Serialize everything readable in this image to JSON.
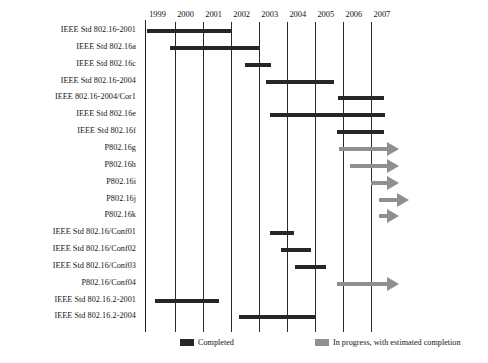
{
  "chart_data": {
    "type": "bar",
    "subtype": "gantt-timeline",
    "title": "",
    "xlabel": "",
    "ylabel": "",
    "xlim": [
      1998.6,
      2008.1
    ],
    "grid": true,
    "legend_position": "bottom-left",
    "x_ticks": [
      "1999",
      "2000",
      "2001",
      "2002",
      "2003",
      "2004",
      "2005",
      "2006",
      "2007"
    ],
    "x_tick_values": [
      1999,
      2000,
      2001,
      2002,
      2003,
      2004,
      2005,
      2006,
      2007
    ],
    "legend": [
      {
        "key": "completed",
        "label": "Completed",
        "color": "#262626"
      },
      {
        "key": "progress",
        "label": "In progress, with estimated completion",
        "color": "#8f8f8f"
      }
    ],
    "categories": [
      "IEEE Std 802.16-2001",
      "IEEE Std 802.16a",
      "IEEE Std 802.16c",
      "IEEE Std 802.16-2004",
      "IEEE 802.16-2004/Cor1",
      "IEEE Std 802.16e",
      "IEEE Std 802.16f",
      "P802.16g",
      "P802.16h",
      "P802.16i",
      "P802.16j",
      "P802.16k",
      "IEEE Std 802.16/Conf01",
      "IEEE Std 802.16/Conf02",
      "IEEE Std 802.16/Conf03",
      "P802.16/Conf04",
      "IEEE Std 802.16.2-2001",
      "IEEE Std 802.16.2-2004"
    ],
    "tasks": [
      {
        "label": "IEEE Std 802.16-2001",
        "start": 1999.0,
        "end": 2002.02,
        "status": "completed",
        "arrow": false
      },
      {
        "label": "IEEE Std 802.16a",
        "start": 1999.85,
        "end": 2003.0,
        "status": "completed",
        "arrow": false
      },
      {
        "label": "IEEE Std 802.16c",
        "start": 2002.5,
        "end": 2003.45,
        "status": "completed",
        "arrow": false
      },
      {
        "label": "IEEE Std 802.16-2004",
        "start": 2003.25,
        "end": 2005.7,
        "status": "completed",
        "arrow": false
      },
      {
        "label": "IEEE 802.16-2004/Cor1",
        "start": 2005.82,
        "end": 2007.45,
        "status": "completed",
        "arrow": false
      },
      {
        "label": "IEEE Std 802.16e",
        "start": 2003.4,
        "end": 2007.5,
        "status": "completed",
        "arrow": false
      },
      {
        "label": "IEEE Std 802.16f",
        "start": 2005.8,
        "end": 2007.45,
        "status": "completed",
        "arrow": false
      },
      {
        "label": "P802.16g",
        "start": 2005.85,
        "end": 2008.0,
        "status": "progress",
        "arrow": true
      },
      {
        "label": "P802.16h",
        "start": 2006.25,
        "end": 2008.0,
        "status": "progress",
        "arrow": true
      },
      {
        "label": "P802.16i",
        "start": 2007.0,
        "end": 2008.0,
        "status": "progress",
        "arrow": true
      },
      {
        "label": "P802.16j",
        "start": 2007.3,
        "end": 2008.35,
        "status": "progress",
        "arrow": true
      },
      {
        "label": "P802.16k",
        "start": 2007.3,
        "end": 2008.0,
        "status": "progress",
        "arrow": true
      },
      {
        "label": "IEEE Std 802.16/Conf01",
        "start": 2003.4,
        "end": 2004.25,
        "status": "completed",
        "arrow": false
      },
      {
        "label": "IEEE Std 802.16/Conf02",
        "start": 2003.8,
        "end": 2004.85,
        "status": "completed",
        "arrow": false
      },
      {
        "label": "IEEE Std 802.16/Conf03",
        "start": 2004.3,
        "end": 2005.4,
        "status": "completed",
        "arrow": false
      },
      {
        "label": "P802.16/Conf04",
        "start": 2005.8,
        "end": 2008.0,
        "status": "progress",
        "arrow": true
      },
      {
        "label": "IEEE Std 802.16.2-2001",
        "start": 1999.3,
        "end": 2001.6,
        "status": "completed",
        "arrow": false
      },
      {
        "label": "IEEE Std 802.16.2-2004",
        "start": 2002.3,
        "end": 2005.05,
        "status": "completed",
        "arrow": false
      }
    ]
  },
  "colors": {
    "completed": "#262626",
    "progress": "#8f8f8f",
    "axis": "#202020",
    "gridline": "#2b2b2b",
    "text": "#141414",
    "background": "#ffffff"
  }
}
